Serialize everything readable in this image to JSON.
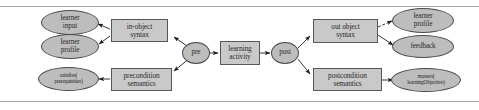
{
  "figure": {
    "background": "#ffffff",
    "box_fill": "#c9c9c9",
    "ellipse_fill": "#bdbdbd",
    "stroke": "#4a4a4a",
    "rule_color": "#a8a8a8"
  },
  "nodes": {
    "learner_input": {
      "label_1": "learner",
      "label_2": "input",
      "shape": "ellipse"
    },
    "learner_profile_left": {
      "label_1": "learner",
      "label_2": "profile",
      "shape": "ellipse"
    },
    "satisfies_prereq": {
      "label_1": "satisfies(",
      "label_2": "prerequisities)",
      "shape": "ellipse"
    },
    "in_object_syntax": {
      "label_1": "in-object",
      "label_2": "syntax",
      "shape": "box"
    },
    "precondition_semantics": {
      "label_1": "precondition",
      "label_2": "semantics",
      "shape": "box"
    },
    "pre": {
      "label_1": "pre",
      "label_2": "",
      "shape": "ellipse"
    },
    "learning_activity": {
      "label_1": "learning",
      "label_2": "activity",
      "shape": "box"
    },
    "post": {
      "label_1": "post",
      "label_2": "",
      "shape": "ellipse"
    },
    "out_object_syntax": {
      "label_1": "out object",
      "label_2": "syntax",
      "shape": "box"
    },
    "postcondition_semantics": {
      "label_1": "postcondition",
      "label_2": "semantics",
      "shape": "box"
    },
    "learner_profile_right": {
      "label_1": "learner",
      "label_2": "profile",
      "shape": "ellipse"
    },
    "feedback": {
      "label_1": "feedback",
      "label_2": "",
      "shape": "ellipse"
    },
    "masters_objective": {
      "label_1": "masters(",
      "label_2": "learningObjective)",
      "shape": "ellipse"
    }
  },
  "edges": [
    {
      "from": "pre",
      "to": "in_object_syntax"
    },
    {
      "from": "pre",
      "to": "precondition_semantics"
    },
    {
      "from": "pre",
      "to": "learning_activity"
    },
    {
      "from": "in_object_syntax",
      "to": "learner_input"
    },
    {
      "from": "in_object_syntax",
      "to": "learner_profile_left"
    },
    {
      "from": "precondition_semantics",
      "to": "satisfies_prereq"
    },
    {
      "from": "learning_activity",
      "to": "post"
    },
    {
      "from": "post",
      "to": "out_object_syntax"
    },
    {
      "from": "post",
      "to": "postcondition_semantics"
    },
    {
      "from": "out_object_syntax",
      "to": "learner_profile_right"
    },
    {
      "from": "out_object_syntax",
      "to": "feedback"
    },
    {
      "from": "postcondition_semantics",
      "to": "masters_objective"
    }
  ]
}
